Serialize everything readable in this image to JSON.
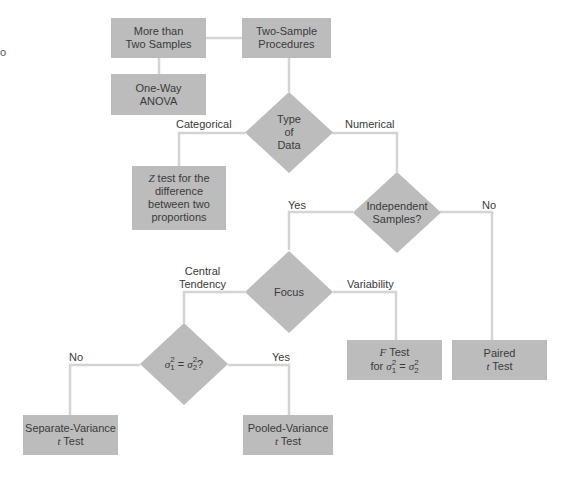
{
  "diagram": {
    "type": "flowchart",
    "colors": {
      "node_fill": "#bcbcbc",
      "line": "#d4d4d4",
      "text": "#3a3a3a",
      "background": "#ffffff"
    },
    "edge_fragment": "o",
    "nodes": {
      "more_than_two": {
        "line1": "More than",
        "line2": "Two Samples"
      },
      "two_sample": {
        "line1": "Two-Sample",
        "line2": "Procedures"
      },
      "anova": {
        "line1": "One-Way",
        "line2": "ANOVA"
      },
      "type_of_data": {
        "line1": "Type",
        "line2": "of",
        "line3": "Data"
      },
      "z_test": {
        "italic": "Z",
        "line1_rest": " test for the",
        "line2": "difference",
        "line3": "between two",
        "line4": "proportions"
      },
      "independent": {
        "line1": "Independent",
        "line2": "Samples?"
      },
      "focus": {
        "line1": "Focus"
      },
      "variance_equal": {
        "sigma": "σ",
        "sub1": "1",
        "sub2": "2",
        "sup": "2",
        "eq": " = ",
        "q": "?"
      },
      "f_test": {
        "italic": "F",
        "line1_rest": " Test",
        "line2_prefix": "for ",
        "sigma": "σ",
        "sub1": "1",
        "sub2": "2",
        "sup": "2",
        "eq": " = "
      },
      "paired": {
        "line1": "Paired",
        "italic": "t",
        "line2_rest": " Test"
      },
      "separate": {
        "line1": "Separate-Variance",
        "italic": "t",
        "line2_rest": " Test"
      },
      "pooled": {
        "line1": "Pooled-Variance",
        "italic": "t",
        "line2_rest": " Test"
      }
    },
    "edge_labels": {
      "categorical": "Categorical",
      "numerical": "Numerical",
      "indep_yes": "Yes",
      "indep_no": "No",
      "central_line1": "Central",
      "central_line2": "Tendency",
      "variability": "Variability",
      "var_no": "No",
      "var_yes": "Yes"
    }
  }
}
